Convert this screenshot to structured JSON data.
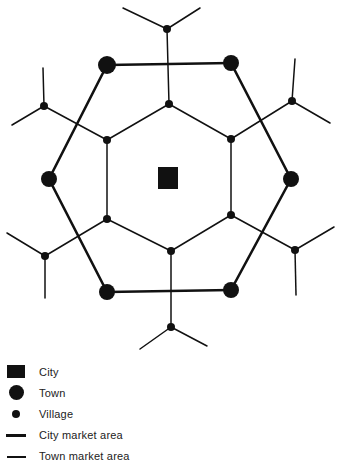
{
  "diagram": {
    "colors": {
      "ink": "#111111",
      "background": "#ffffff"
    },
    "city": {
      "x": 168,
      "y": 178,
      "size": 21
    },
    "towns": [
      {
        "x": 107,
        "y": 65
      },
      {
        "x": 231,
        "y": 63
      },
      {
        "x": 49,
        "y": 179
      },
      {
        "x": 291,
        "y": 179
      },
      {
        "x": 107,
        "y": 292
      },
      {
        "x": 231,
        "y": 290
      }
    ],
    "inner_villages": [
      {
        "x": 169,
        "y": 104
      },
      {
        "x": 107,
        "y": 140
      },
      {
        "x": 231,
        "y": 139
      },
      {
        "x": 107,
        "y": 219
      },
      {
        "x": 231,
        "y": 215
      },
      {
        "x": 171,
        "y": 251
      }
    ],
    "outer_villages": [
      {
        "x": 167,
        "y": 29
      },
      {
        "x": 44,
        "y": 106
      },
      {
        "x": 292,
        "y": 101
      },
      {
        "x": 45,
        "y": 256
      },
      {
        "x": 295,
        "y": 250
      },
      {
        "x": 171,
        "y": 327
      }
    ]
  },
  "legend": {
    "items": [
      {
        "symbol": "city-square",
        "label": "City"
      },
      {
        "symbol": "town-circle",
        "label": "Town"
      },
      {
        "symbol": "village-dot",
        "label": "Village"
      },
      {
        "symbol": "thick-line",
        "label": "City market area"
      },
      {
        "symbol": "thin-line",
        "label": "Town market area"
      }
    ]
  }
}
